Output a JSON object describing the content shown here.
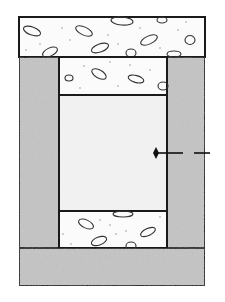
{
  "diagram": {
    "colors": {
      "background": "#ffffff",
      "outline": "#1a1a1a",
      "concrete_fill": "#fbfbfb",
      "gray_fill": "#c4c4c4",
      "core_fill": "#f1f1f1",
      "aggregate_stroke": "#333333",
      "speck": "#999999"
    },
    "regions": [
      {
        "id": "top-concrete-band",
        "label": "concrete (aggregate pattern)"
      },
      {
        "id": "left-gray-column",
        "label": "gray column"
      },
      {
        "id": "right-gray-column",
        "label": "gray column"
      },
      {
        "id": "upper-inner-concrete",
        "label": "concrete (aggregate pattern)"
      },
      {
        "id": "center-core",
        "label": "light gray core"
      },
      {
        "id": "lower-inner-concrete",
        "label": "concrete (aggregate pattern)"
      },
      {
        "id": "bottom-gray-base",
        "label": "gray base"
      }
    ],
    "pointer": {
      "label": "",
      "style": "dashed leader with diamond head"
    }
  }
}
